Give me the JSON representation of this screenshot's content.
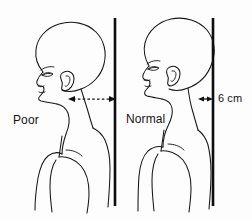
{
  "diagram": {
    "background_color": "#fdfdfd",
    "line_color": "#161616",
    "labels": {
      "poor": "Poor",
      "normal": "Normal",
      "measurement": "6 cm"
    },
    "figures": [
      {
        "id": "left-figure",
        "name": "poor-posture-figure",
        "label": "Poor",
        "description": "Profile of bald head and shoulders with forward head posture",
        "deviation": "6 cm"
      },
      {
        "id": "right-figure",
        "name": "normal-posture-figure",
        "label": "Normal",
        "description": "Profile of bald head and shoulders with aligned head posture",
        "deviation": "6 cm"
      }
    ],
    "annotations": [
      {
        "name": "poor-offset-arrow",
        "style": "dashed-double-headed",
        "orientation": "horizontal",
        "value": ""
      },
      {
        "name": "normal-offset-arrow",
        "style": "solid-double-headed",
        "orientation": "horizontal",
        "value": "6 cm"
      }
    ],
    "plumb_lines": [
      {
        "name": "left-plumb-line",
        "x": 115
      },
      {
        "name": "right-plumb-line",
        "x": 213
      }
    ]
  }
}
